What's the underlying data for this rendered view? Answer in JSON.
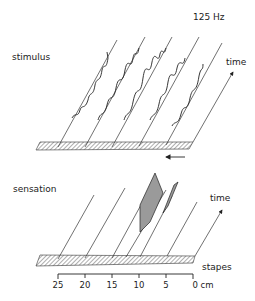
{
  "frequency_label": "125 Hz",
  "top_panel": {
    "label": "stimulus",
    "axis_label": "time",
    "direction_arrow": "left-arrow"
  },
  "bottom_panel": {
    "label": "sensation",
    "axis_label": "time",
    "base_label": "stapes"
  },
  "scale": {
    "ticks": [
      "25",
      "20",
      "15",
      "10",
      "5",
      "0 cm"
    ]
  },
  "colors": {
    "ink": "#222222",
    "shade": "#9a9a9a"
  }
}
